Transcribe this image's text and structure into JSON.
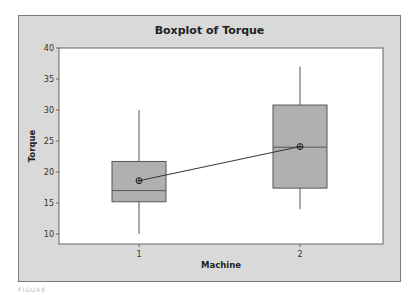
{
  "chart_data": {
    "type": "boxplot",
    "title": "Boxplot of Torque",
    "xlabel": "Machine",
    "ylabel": "Torque",
    "categories": [
      "1",
      "2"
    ],
    "ylim": [
      9,
      40.5
    ],
    "yticks": [
      10,
      15,
      20,
      25,
      30,
      35,
      40
    ],
    "grid": false,
    "legend": null,
    "series": [
      {
        "name": "1",
        "whisker_low": 10,
        "q1": 15.2,
        "median": 17,
        "q3": 21.7,
        "whisker_high": 30,
        "mean": 18.6
      },
      {
        "name": "2",
        "whisker_low": 14,
        "q1": 17.4,
        "median": 24,
        "q3": 30.8,
        "whisker_high": 37,
        "mean": 24.1
      }
    ],
    "mean_connect_line": true,
    "colors": {
      "frame_bg": "#d9d9d9",
      "plot_bg": "#ffffff",
      "box_fill": "#b0b0b0",
      "line": "#555555"
    }
  },
  "caption": "FIGURE"
}
